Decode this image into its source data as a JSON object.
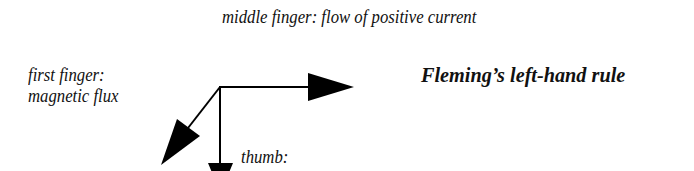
{
  "diagram": {
    "title": "Fleming’s left-hand rule",
    "labels": {
      "middle_finger": "middle finger: flow of positive current",
      "first_finger_line1": "first finger:",
      "first_finger_line2": "magnetic flux",
      "thumb": "thumb:"
    },
    "arrows": [
      {
        "name": "current",
        "direction": "right"
      },
      {
        "name": "flux",
        "direction": "down-left"
      },
      {
        "name": "motion",
        "direction": "down"
      }
    ],
    "color": "#000000"
  }
}
